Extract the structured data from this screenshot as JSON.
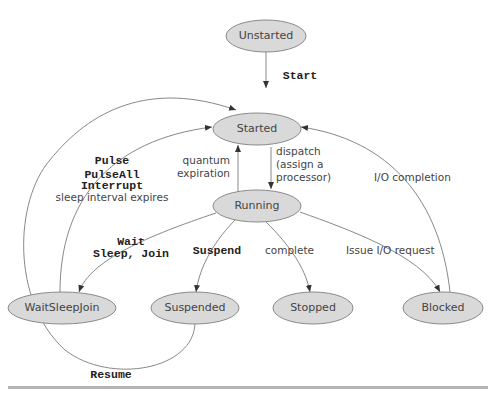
{
  "diagram": {
    "states": {
      "unstarted": "Unstarted",
      "started": "Started",
      "running": "Running",
      "waitsleepjoin": "WaitSleepJoin",
      "suspended": "Suspended",
      "stopped": "Stopped",
      "blocked": "Blocked"
    },
    "transitions": {
      "start": "Start",
      "quantum_line1": "quantum",
      "quantum_line2": "expiration",
      "dispatch_line1": "dispatch",
      "dispatch_line2": "(assign a",
      "dispatch_line3": "processor)",
      "io_completion": "I/O completion",
      "pulse": "Pulse",
      "pulseall": "PulseAll",
      "interrupt": "Interrupt",
      "sleep_expires": "sleep interval expires",
      "wait": "Wait",
      "sleep_join": "Sleep, Join",
      "suspend": "Suspend",
      "complete": "complete",
      "issue_io": "Issue I/O request",
      "resume": "Resume"
    },
    "colors": {
      "node_fill": "#d9d9d9",
      "node_stroke": "#8a8a8a",
      "edge": "#7a7a7a",
      "rule": "#b5b5b5"
    }
  }
}
